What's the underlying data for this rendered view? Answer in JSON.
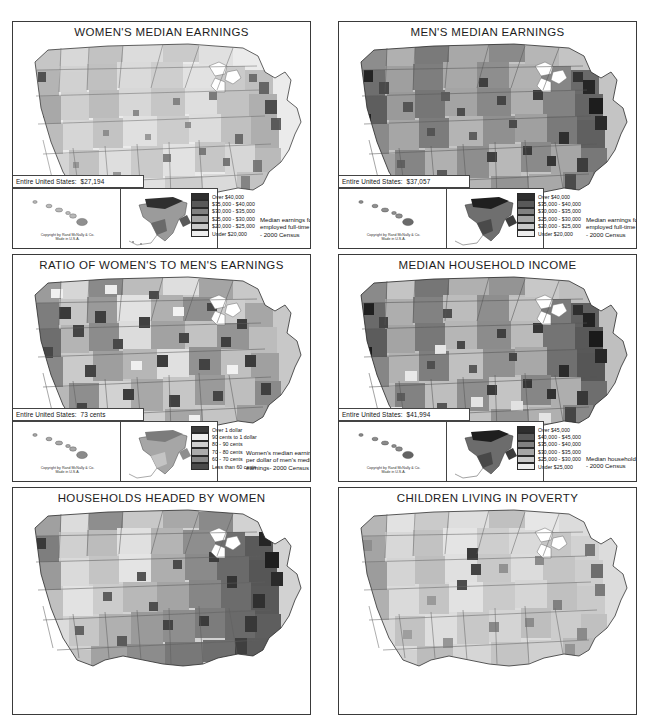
{
  "document": {
    "kind": "atlas-thematic-map-sheet",
    "publisher_credit": "Copyright by Rand McNally & Co.",
    "publisher_credit_line2": "Made in U.S.A."
  },
  "panels": [
    {
      "id": "womens-median-earnings",
      "title": "WOMEN'S MEDIAN EARNINGS",
      "national_stat_label": "Entire United States:",
      "national_stat_value": "$27,194",
      "legend": {
        "entries": [
          {
            "label": "Over $40,000",
            "color": "#2e2e2e"
          },
          {
            "label": "$35,000 - $40,000",
            "color": "#595959"
          },
          {
            "label": "$30,000 - $35,000",
            "color": "#818181"
          },
          {
            "label": "$25,000 - $30,000",
            "color": "#a5a5a5"
          },
          {
            "label": "$20,000 - $25,000",
            "color": "#c9c9c9"
          },
          {
            "label": "Under $20,000",
            "color": "#ededed"
          }
        ],
        "caption": "Median earnings for women\nemployed full-time\n- 2000 Census"
      }
    },
    {
      "id": "mens-median-earnings",
      "title": "MEN'S MEDIAN EARNINGS",
      "national_stat_label": "Entire United States:",
      "national_stat_value": "$37,057",
      "legend": {
        "entries": [
          {
            "label": "Over $40,000",
            "color": "#2e2e2e"
          },
          {
            "label": "$35,000 - $40,000",
            "color": "#595959"
          },
          {
            "label": "$30,000 - $35,000",
            "color": "#818181"
          },
          {
            "label": "$25,000 - $30,000",
            "color": "#a5a5a5"
          },
          {
            "label": "$20,000 - $25,000",
            "color": "#c9c9c9"
          },
          {
            "label": "Under $20,000",
            "color": "#ededed"
          }
        ],
        "caption": "Median earnings for men\nemployed full-time\n- 2000 Census"
      }
    },
    {
      "id": "ratio-womens-to-mens-earnings",
      "title": "RATIO OF WOMEN'S TO MEN'S EARNINGS",
      "national_stat_label": "Entire United States:",
      "national_stat_value": "73 cents",
      "legend": {
        "entries": [
          {
            "label": "Over 1 dollar",
            "color": "#3b3b3b"
          },
          {
            "label": "90 cents to 1 dollar",
            "color": "#efefef"
          },
          {
            "label": "80 - 90 cents",
            "color": "#cfcfcf"
          },
          {
            "label": "70 - 80 cents",
            "color": "#ababab"
          },
          {
            "label": "60 - 70 cents",
            "color": "#888888"
          },
          {
            "label": "Less than 60 cents",
            "color": "#4a4a4a"
          }
        ],
        "caption": "Women's median earnings\nper dollar of men's median\nearnings- 2000 Census"
      }
    },
    {
      "id": "median-household-income",
      "title": "MEDIAN HOUSEHOLD INCOME",
      "national_stat_label": "Entire United States:",
      "national_stat_value": "$41,994",
      "legend": {
        "entries": [
          {
            "label": "Over $45,000",
            "color": "#2e2e2e"
          },
          {
            "label": "$40,000 - $45,000",
            "color": "#595959"
          },
          {
            "label": "$35,000 - $40,000",
            "color": "#818181"
          },
          {
            "label": "$30,000 - $35,000",
            "color": "#a5a5a5"
          },
          {
            "label": "$25,000 - $30,000",
            "color": "#c9c9c9"
          },
          {
            "label": "Under $25,000",
            "color": "#ededed"
          }
        ],
        "caption": "Median household income\n- 2000 Census"
      }
    },
    {
      "id": "households-headed-by-women",
      "title": "HOUSEHOLDS HEADED BY WOMEN"
    },
    {
      "id": "children-living-in-poverty",
      "title": "CHILDREN LIVING IN POVERTY"
    }
  ]
}
